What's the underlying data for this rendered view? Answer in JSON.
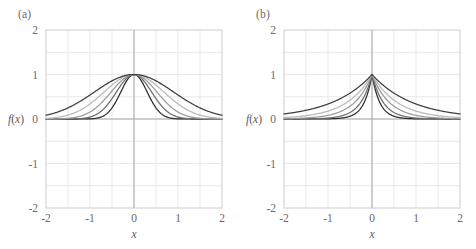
{
  "figure": {
    "background": "#ffffff",
    "width": 476,
    "height": 249,
    "panel_a_label": "(a)",
    "panel_b_label": "(b)"
  },
  "axes": {
    "x_label": "x",
    "y_label": "f(x)",
    "x_ticks": [
      "-2",
      "-1",
      "0",
      "1",
      "2"
    ],
    "y_ticks": [
      "2",
      "1",
      "0",
      "-1",
      "-2"
    ],
    "x_tick_values": [
      -2,
      -1,
      0,
      1,
      2
    ],
    "y_tick_values": [
      2,
      1,
      0,
      -1,
      -2
    ],
    "xlim": [
      -2,
      2
    ],
    "ylim": [
      -2,
      2
    ],
    "grid_step": 0.5,
    "grid_color": "#e8e8ea",
    "frame_color": "#d8d8da",
    "zero_line_color": "#a8a8aa",
    "tick_color": "#6a6a6c"
  },
  "chart_data": [
    {
      "type": "line",
      "panel": "(a)",
      "title": "",
      "xlabel": "x",
      "ylabel": "f(x)",
      "xlim": [
        -2,
        2
      ],
      "ylim": [
        -2,
        2
      ],
      "grid": true,
      "legend": "none",
      "function": "gaussian",
      "formula": "f(x) = exp(-x^2 / (2*sigma^2))",
      "x": [
        -2,
        -1.75,
        -1.5,
        -1.25,
        -1,
        -0.75,
        -0.5,
        -0.25,
        0,
        0.25,
        0.5,
        0.75,
        1,
        1.25,
        1.5,
        1.75,
        2
      ],
      "series": [
        {
          "name": "sigma = 0.30",
          "color": "#2b2b2b",
          "sigma": 0.3,
          "values": [
            0,
            0,
            0,
            0,
            0.004,
            0.044,
            0.249,
            0.707,
            1,
            0.707,
            0.249,
            0.044,
            0.004,
            0,
            0,
            0,
            0
          ]
        },
        {
          "name": "sigma = 0.40",
          "color": "#6b6b6b",
          "sigma": 0.4,
          "values": [
            0,
            0.001,
            0.003,
            0.019,
            0.044,
            0.174,
            0.458,
            0.821,
            1,
            0.821,
            0.458,
            0.174,
            0.044,
            0.019,
            0.003,
            0.001,
            0
          ]
        },
        {
          "name": "sigma = 0.52",
          "color": "#9a9a9a",
          "sigma": 0.52,
          "values": [
            0.002,
            0.011,
            0.036,
            0.096,
            0.155,
            0.348,
            0.629,
            0.892,
            1,
            0.892,
            0.629,
            0.348,
            0.155,
            0.096,
            0.036,
            0.011,
            0.002
          ]
        },
        {
          "name": "sigma = 0.68",
          "color": "#b9b9b9",
          "sigma": 0.68,
          "values": [
            0.014,
            0.038,
            0.087,
            0.183,
            0.294,
            0.541,
            0.765,
            0.935,
            1,
            0.935,
            0.765,
            0.541,
            0.294,
            0.183,
            0.087,
            0.038,
            0.014
          ]
        },
        {
          "name": "sigma = 0.90",
          "color": "#3d3d3d",
          "sigma": 0.9,
          "values": [
            0.085,
            0.183,
            0.249,
            0.38,
            0.54,
            0.706,
            0.856,
            0.962,
            1,
            0.962,
            0.856,
            0.706,
            0.54,
            0.38,
            0.249,
            0.183,
            0.085
          ]
        }
      ]
    },
    {
      "type": "line",
      "panel": "(b)",
      "title": "",
      "xlabel": "x",
      "ylabel": "f(x)",
      "xlim": [
        -2,
        2
      ],
      "ylim": [
        -2,
        2
      ],
      "grid": true,
      "legend": "none",
      "function": "laplacian",
      "formula": "f(x) = exp(-|x| / b)",
      "x": [
        -2,
        -1.75,
        -1.5,
        -1.25,
        -1,
        -0.75,
        -0.5,
        -0.25,
        0,
        0.25,
        0.5,
        0.75,
        1,
        1.25,
        1.5,
        1.75,
        2
      ],
      "series": [
        {
          "name": "b = 0.18",
          "color": "#2b2b2b",
          "b": 0.18,
          "values": [
            0,
            0,
            0,
            0.001,
            0.004,
            0.015,
            0.062,
            0.25,
            1,
            0.25,
            0.062,
            0.015,
            0.004,
            0.001,
            0,
            0
          ]
        },
        {
          "name": "b = 0.26",
          "color": "#6b6b6b",
          "b": 0.26,
          "values": [
            0.001,
            0.001,
            0.003,
            0.008,
            0.021,
            0.056,
            0.146,
            0.382,
            1,
            0.382,
            0.146,
            0.056,
            0.021,
            0.008,
            0.003,
            0.001,
            0.001
          ]
        },
        {
          "name": "b = 0.40",
          "color": "#9a9a9a",
          "b": 0.4,
          "values": [
            0.007,
            0.012,
            0.023,
            0.044,
            0.082,
            0.153,
            0.287,
            0.535,
            1,
            0.535,
            0.287,
            0.153,
            0.082,
            0.044,
            0.023,
            0.012,
            0.007
          ]
        },
        {
          "name": "b = 0.58",
          "color": "#b9b9b9",
          "b": 0.58,
          "values": [
            0.032,
            0.049,
            0.074,
            0.115,
            0.178,
            0.274,
            0.422,
            0.65,
            1,
            0.65,
            0.422,
            0.274,
            0.178,
            0.115,
            0.074,
            0.049,
            0.032
          ]
        },
        {
          "name": "b = 0.92",
          "color": "#3d3d3d",
          "b": 0.92,
          "values": [
            0.114,
            0.149,
            0.195,
            0.256,
            0.335,
            0.44,
            0.577,
            0.76,
            1,
            0.76,
            0.577,
            0.44,
            0.335,
            0.256,
            0.195,
            0.149,
            0.114
          ]
        }
      ]
    }
  ]
}
